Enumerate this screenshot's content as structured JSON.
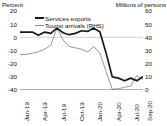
{
  "chart_data": {
    "type": "line",
    "title": "",
    "xlabel": "",
    "ylabel": "Percent",
    "y2label": "Millions of persons",
    "grid": "zero-line-only",
    "legend_position": "top-left",
    "ylim": [
      -40,
      20
    ],
    "y2lim": [
      0,
      60
    ],
    "yticks": [
      "20",
      "10",
      "0",
      "-10",
      "-20",
      "-30",
      "-40"
    ],
    "y2ticks": [
      "60",
      "50",
      "40",
      "30",
      "20",
      "10",
      "0"
    ],
    "x": [
      "Jan-19",
      "Feb-19",
      "Mar-19",
      "Apr-19",
      "May-19",
      "Jun-19",
      "Jul-19",
      "Aug-19",
      "Sep-19",
      "Oct-19",
      "Nov-19",
      "Dec-19",
      "Jan-20",
      "Feb-20",
      "Mar-20",
      "Apr-20",
      "May-20",
      "Jun-20",
      "Jul-20",
      "Aug-20",
      "Sep-20"
    ],
    "xtick_labels": [
      "Jan-19",
      "Apr-19",
      "Jul-19",
      "Oct-19",
      "Jan-20",
      "Apr-20",
      "Jul-20",
      "Sep-20"
    ],
    "xtick_indices": [
      0,
      3,
      6,
      9,
      12,
      15,
      18,
      20
    ],
    "series": [
      {
        "name": "Services exports",
        "axis": "left",
        "unit": "percent",
        "color": "#1a1a1a",
        "values": [
          4,
          4,
          4,
          1.5,
          4,
          3,
          7,
          3.5,
          2,
          3,
          5,
          4.5,
          7,
          4,
          -12,
          -30,
          -31,
          -33,
          -31,
          -33,
          -30
        ]
      },
      {
        "name": "Tourist arrivals (RHS)",
        "axis": "right",
        "unit": "millions of persons",
        "color": "#8a8a8a",
        "values": [
          27,
          27,
          28,
          29,
          31,
          34,
          47,
          38,
          33,
          32,
          31,
          29,
          33,
          28,
          14,
          0.5,
          1,
          2,
          3,
          11,
          8
        ]
      }
    ]
  },
  "axes": {
    "left_title": "Percent",
    "right_title": "Millions of persons"
  },
  "legend": {
    "items": [
      {
        "label": "Services exports",
        "marker": "thick-line"
      },
      {
        "label": "Tourist arrivals (RHS)",
        "marker": "thin-line"
      }
    ]
  },
  "colors": {
    "services_exports": "#1a1a1a",
    "tourist_arrivals": "#8a8a8a",
    "zero_line": "#d9d9d9",
    "axis": "#333333",
    "text": "#111111",
    "background": "#ffffff"
  }
}
